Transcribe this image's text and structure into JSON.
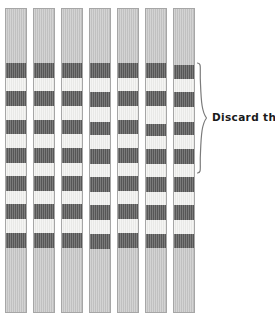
{
  "figure": {
    "title": "",
    "background_color": "#ffffff",
    "width": 275,
    "height": 329
  },
  "annotation": {
    "label": "Discard these.",
    "brace_icon": "curly-brace-icon",
    "brace": {
      "x": 196,
      "y": 62,
      "width": 11,
      "height": 110
    },
    "label_position": {
      "x": 212,
      "y": 111
    }
  },
  "colors": {
    "dark_band": "#5a5a5a",
    "light_band": "#f3f3f1",
    "blank_region": "#c9c9c9",
    "lane_border": "#a6a6a6",
    "text": "#1a1a1a"
  },
  "lanes": {
    "count": 7,
    "width": 22,
    "pitch": 28,
    "start_x": 5,
    "top_y": 8,
    "bottom_y": 313,
    "blank_top_end_y": 62,
    "blank_bottom_start_y": 254,
    "band_height": 14,
    "items": [
      {
        "name": "lane-1",
        "x": 5,
        "bands": [
          {
            "type": "blank",
            "y": 0,
            "h": 54
          },
          {
            "type": "dark",
            "y": 54,
            "h": 15
          },
          {
            "type": "light",
            "y": 69,
            "h": 13
          },
          {
            "type": "dark",
            "y": 82,
            "h": 15
          },
          {
            "type": "light",
            "y": 97,
            "h": 14
          },
          {
            "type": "dark",
            "y": 111,
            "h": 14
          },
          {
            "type": "light",
            "y": 125,
            "h": 14
          },
          {
            "type": "dark",
            "y": 139,
            "h": 15
          },
          {
            "type": "light",
            "y": 154,
            "h": 13
          },
          {
            "type": "dark",
            "y": 167,
            "h": 15
          },
          {
            "type": "light",
            "y": 182,
            "h": 13
          },
          {
            "type": "dark",
            "y": 195,
            "h": 15
          },
          {
            "type": "light",
            "y": 210,
            "h": 14
          },
          {
            "type": "dark",
            "y": 224,
            "h": 15
          },
          {
            "type": "blank",
            "y": 239,
            "h": 64
          }
        ]
      },
      {
        "name": "lane-2",
        "x": 33,
        "bands": [
          {
            "type": "blank",
            "y": 0,
            "h": 54
          },
          {
            "type": "dark",
            "y": 54,
            "h": 15
          },
          {
            "type": "light",
            "y": 69,
            "h": 13
          },
          {
            "type": "dark",
            "y": 82,
            "h": 15
          },
          {
            "type": "light",
            "y": 97,
            "h": 14
          },
          {
            "type": "dark",
            "y": 111,
            "h": 14
          },
          {
            "type": "light",
            "y": 125,
            "h": 14
          },
          {
            "type": "dark",
            "y": 139,
            "h": 15
          },
          {
            "type": "light",
            "y": 154,
            "h": 13
          },
          {
            "type": "dark",
            "y": 167,
            "h": 15
          },
          {
            "type": "light",
            "y": 182,
            "h": 13
          },
          {
            "type": "dark",
            "y": 195,
            "h": 15
          },
          {
            "type": "light",
            "y": 210,
            "h": 14
          },
          {
            "type": "dark",
            "y": 224,
            "h": 15
          },
          {
            "type": "blank",
            "y": 239,
            "h": 64
          }
        ]
      },
      {
        "name": "lane-3",
        "x": 61,
        "bands": [
          {
            "type": "blank",
            "y": 0,
            "h": 54
          },
          {
            "type": "dark",
            "y": 54,
            "h": 15
          },
          {
            "type": "light",
            "y": 69,
            "h": 13
          },
          {
            "type": "dark",
            "y": 82,
            "h": 15
          },
          {
            "type": "light",
            "y": 97,
            "h": 14
          },
          {
            "type": "dark",
            "y": 111,
            "h": 14
          },
          {
            "type": "light",
            "y": 125,
            "h": 14
          },
          {
            "type": "dark",
            "y": 139,
            "h": 15
          },
          {
            "type": "light",
            "y": 154,
            "h": 13
          },
          {
            "type": "dark",
            "y": 167,
            "h": 15
          },
          {
            "type": "light",
            "y": 182,
            "h": 13
          },
          {
            "type": "dark",
            "y": 195,
            "h": 15
          },
          {
            "type": "light",
            "y": 210,
            "h": 14
          },
          {
            "type": "dark",
            "y": 224,
            "h": 15
          },
          {
            "type": "blank",
            "y": 239,
            "h": 64
          }
        ]
      },
      {
        "name": "lane-4",
        "x": 89,
        "bands": [
          {
            "type": "blank",
            "y": 0,
            "h": 54
          },
          {
            "type": "dark",
            "y": 54,
            "h": 15
          },
          {
            "type": "light",
            "y": 69,
            "h": 14
          },
          {
            "type": "dark",
            "y": 83,
            "h": 15
          },
          {
            "type": "light",
            "y": 98,
            "h": 15
          },
          {
            "type": "dark",
            "y": 113,
            "h": 13
          },
          {
            "type": "light",
            "y": 126,
            "h": 14
          },
          {
            "type": "dark",
            "y": 140,
            "h": 15
          },
          {
            "type": "light",
            "y": 155,
            "h": 13
          },
          {
            "type": "dark",
            "y": 168,
            "h": 15
          },
          {
            "type": "light",
            "y": 183,
            "h": 13
          },
          {
            "type": "dark",
            "y": 196,
            "h": 15
          },
          {
            "type": "light",
            "y": 211,
            "h": 14
          },
          {
            "type": "dark",
            "y": 225,
            "h": 15
          },
          {
            "type": "blank",
            "y": 240,
            "h": 63
          }
        ]
      },
      {
        "name": "lane-5",
        "x": 117,
        "bands": [
          {
            "type": "blank",
            "y": 0,
            "h": 54
          },
          {
            "type": "dark",
            "y": 54,
            "h": 15
          },
          {
            "type": "light",
            "y": 69,
            "h": 13
          },
          {
            "type": "dark",
            "y": 82,
            "h": 15
          },
          {
            "type": "light",
            "y": 97,
            "h": 14
          },
          {
            "type": "dark",
            "y": 111,
            "h": 14
          },
          {
            "type": "light",
            "y": 125,
            "h": 14
          },
          {
            "type": "dark",
            "y": 139,
            "h": 15
          },
          {
            "type": "light",
            "y": 154,
            "h": 13
          },
          {
            "type": "dark",
            "y": 167,
            "h": 15
          },
          {
            "type": "light",
            "y": 182,
            "h": 13
          },
          {
            "type": "dark",
            "y": 195,
            "h": 15
          },
          {
            "type": "light",
            "y": 210,
            "h": 14
          },
          {
            "type": "dark",
            "y": 224,
            "h": 15
          },
          {
            "type": "blank",
            "y": 239,
            "h": 64
          }
        ]
      },
      {
        "name": "lane-6",
        "x": 145,
        "bands": [
          {
            "type": "blank",
            "y": 0,
            "h": 54
          },
          {
            "type": "dark",
            "y": 54,
            "h": 15
          },
          {
            "type": "light",
            "y": 69,
            "h": 13
          },
          {
            "type": "dark",
            "y": 82,
            "h": 15
          },
          {
            "type": "light",
            "y": 97,
            "h": 18
          },
          {
            "type": "dark",
            "y": 115,
            "h": 12
          },
          {
            "type": "light",
            "y": 127,
            "h": 13
          },
          {
            "type": "dark",
            "y": 140,
            "h": 15
          },
          {
            "type": "light",
            "y": 155,
            "h": 13
          },
          {
            "type": "dark",
            "y": 168,
            "h": 15
          },
          {
            "type": "light",
            "y": 183,
            "h": 13
          },
          {
            "type": "dark",
            "y": 196,
            "h": 15
          },
          {
            "type": "light",
            "y": 211,
            "h": 14
          },
          {
            "type": "dark",
            "y": 225,
            "h": 14
          },
          {
            "type": "blank",
            "y": 239,
            "h": 64
          }
        ]
      },
      {
        "name": "lane-7",
        "x": 173,
        "bands": [
          {
            "type": "blank",
            "y": 0,
            "h": 56
          },
          {
            "type": "dark",
            "y": 56,
            "h": 14
          },
          {
            "type": "light",
            "y": 70,
            "h": 13
          },
          {
            "type": "dark",
            "y": 83,
            "h": 15
          },
          {
            "type": "light",
            "y": 98,
            "h": 15
          },
          {
            "type": "dark",
            "y": 113,
            "h": 13
          },
          {
            "type": "light",
            "y": 126,
            "h": 14
          },
          {
            "type": "dark",
            "y": 140,
            "h": 15
          },
          {
            "type": "light",
            "y": 155,
            "h": 13
          },
          {
            "type": "dark",
            "y": 168,
            "h": 15
          },
          {
            "type": "light",
            "y": 183,
            "h": 13
          },
          {
            "type": "dark",
            "y": 196,
            "h": 15
          },
          {
            "type": "light",
            "y": 211,
            "h": 14
          },
          {
            "type": "dark",
            "y": 225,
            "h": 14
          },
          {
            "type": "blank",
            "y": 239,
            "h": 64
          }
        ]
      }
    ]
  }
}
